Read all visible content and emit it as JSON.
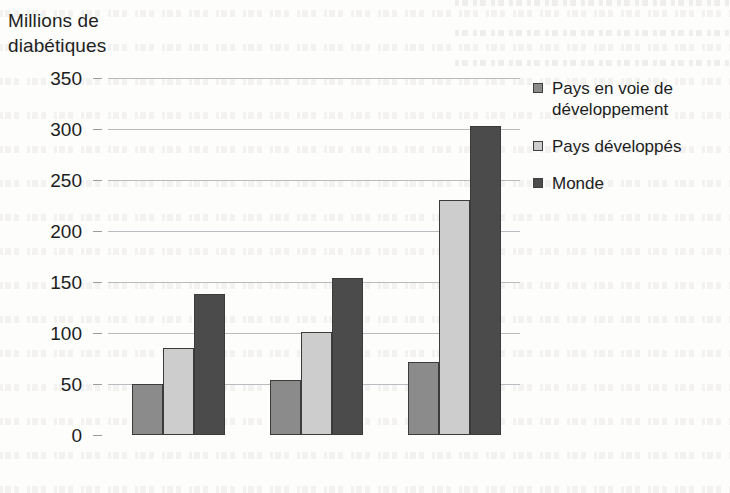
{
  "chart_data": {
    "type": "bar",
    "title": "Millions de\ndiabétiques",
    "title_lines": [
      "Millions de",
      "diabétiques"
    ],
    "xlabel": "",
    "ylabel": "Millions de diabétiques",
    "categories": [
      "1995",
      "2000",
      "2025"
    ],
    "series": [
      {
        "name": "Pays en voie de développement",
        "color": "#8b8b8b",
        "values": [
          50,
          54,
          72
        ]
      },
      {
        "name": "Pays développés",
        "color": "#cdcdcd",
        "values": [
          85,
          101,
          230
        ]
      },
      {
        "name": "Monde",
        "color": "#4b4b4b",
        "values": [
          138,
          154,
          303
        ]
      }
    ],
    "ylim": [
      0,
      350
    ],
    "ytick_labels": [
      "350",
      "300",
      "250",
      "200",
      "150",
      "100",
      "50",
      "0"
    ],
    "ytick_values": [
      350,
      300,
      250,
      200,
      150,
      100,
      50,
      0
    ],
    "grid": true,
    "grid_color": "#b9bcbe",
    "legend_position": "right",
    "legend": [
      {
        "label": "Pays en voie de développement",
        "swatch": "#8b8b8b"
      },
      {
        "label": "Pays développés",
        "swatch": "#cdcdcd"
      },
      {
        "label": "Monde",
        "swatch": "#4b4b4b"
      }
    ]
  }
}
